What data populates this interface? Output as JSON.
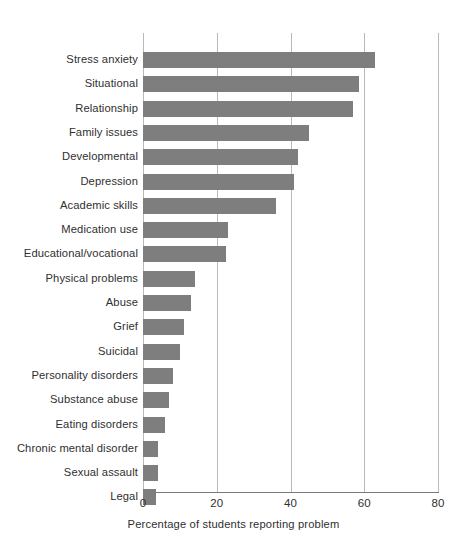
{
  "chart_data": {
    "type": "bar",
    "orientation": "horizontal",
    "title": "",
    "xlabel": "Percentage of students reporting problem",
    "ylabel": "",
    "xlim": [
      0,
      80
    ],
    "xticks": [
      0,
      20,
      40,
      60,
      80
    ],
    "xtick_labels": [
      "0",
      "20",
      "40",
      "60",
      "80"
    ],
    "grid": "vertical",
    "legend": "none",
    "bar_color": "#7e7e7e",
    "gridline_color": "#b9b9b9",
    "axis_color": "#7a7a7a",
    "categories": [
      "Stress anxiety",
      "Situational",
      "Relationship",
      "Family issues",
      "Developmental",
      "Depression",
      "Academic skills",
      "Medication use",
      "Educational/vocational",
      "Physical problems",
      "Abuse",
      "Grief",
      "Suicidal",
      "Personality disorders",
      "Substance abuse",
      "Eating disorders",
      "Chronic mental disorder",
      "Sexual assault",
      "Legal"
    ],
    "values": [
      63,
      58.5,
      57,
      45,
      42,
      41,
      36,
      23,
      22.5,
      14,
      13,
      11,
      10,
      8,
      7,
      6,
      4,
      4,
      3.5
    ]
  }
}
